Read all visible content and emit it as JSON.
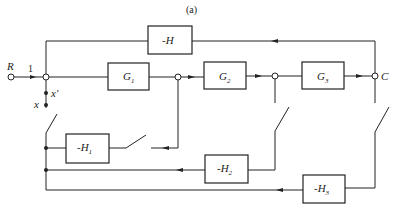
{
  "figure": {
    "caption": "(a)",
    "input_label": "R",
    "input_gain": "1",
    "output_label": "C",
    "tap_labels": {
      "x_prime": "x'",
      "x": "x"
    }
  },
  "blocks": {
    "G1": {
      "name": "G",
      "sub": "1"
    },
    "G2": {
      "name": "G",
      "sub": "2"
    },
    "G3": {
      "name": "G",
      "sub": "3"
    },
    "H": {
      "name": "-H",
      "sub": ""
    },
    "H1": {
      "name": "-H",
      "sub": "1"
    },
    "H2": {
      "name": "-H",
      "sub": "2"
    },
    "H3": {
      "name": "-H",
      "sub": "3"
    }
  }
}
